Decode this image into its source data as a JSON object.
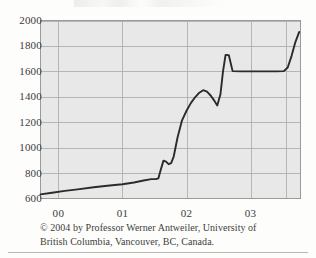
{
  "figure": {
    "title_remnant": "",
    "caption_line1": "© 2004 by Professor Werner Antweiler, University of",
    "caption_line2": "British Columbia, Vancouver, BC, Canada.",
    "caption_full": "© 2004 by Professor Werner Antweiler, University of British Columbia, Vancouver, BC, Canada."
  },
  "colors": {
    "page_background": "#fdfdfb",
    "plot_background": "#e8e8e8",
    "gridline": "#b0b0b0",
    "plot_border": "#9a9a9a",
    "line": "#2b2b2b",
    "text": "#3b3b3b",
    "rule": "#b9b7b2"
  },
  "chart_data": {
    "type": "line",
    "title": "",
    "xlabel": "",
    "ylabel": "",
    "xlim": [
      1999.72,
      2003.78
    ],
    "ylim": [
      600,
      2000
    ],
    "grid": true,
    "legend": null,
    "legend_position": "none",
    "ytick_labels": [
      "2000",
      "1800",
      "1600",
      "1400",
      "1200",
      "1000",
      "800",
      "600"
    ],
    "ytick_values": [
      2000,
      1800,
      1600,
      1400,
      1200,
      1000,
      800,
      600
    ],
    "xtick_labels": [
      "00",
      "01",
      "02",
      "03"
    ],
    "xtick_values": [
      2000,
      2001,
      2002,
      2003
    ],
    "series": [
      {
        "name": "value",
        "x": [
          1999.72,
          1999.9,
          2000.1,
          2000.3,
          2000.55,
          2000.8,
          2001.0,
          2001.18,
          2001.33,
          2001.45,
          2001.52,
          2001.56,
          2001.6,
          2001.64,
          2001.68,
          2001.72,
          2001.76,
          2001.8,
          2001.86,
          2001.93,
          2002.0,
          2002.07,
          2002.14,
          2002.2,
          2002.26,
          2002.32,
          2002.38,
          2002.43,
          2002.48,
          2002.53,
          2002.57,
          2002.61,
          2002.66,
          2002.72,
          2002.85,
          2003.0,
          2003.2,
          2003.4,
          2003.52,
          2003.58,
          2003.64,
          2003.7,
          2003.76
        ],
        "y": [
          632,
          645,
          660,
          672,
          688,
          702,
          712,
          726,
          742,
          752,
          752,
          758,
          830,
          898,
          890,
          870,
          878,
          930,
          1080,
          1215,
          1290,
          1352,
          1400,
          1432,
          1452,
          1440,
          1408,
          1372,
          1332,
          1420,
          1600,
          1730,
          1728,
          1602,
          1600,
          1600,
          1600,
          1600,
          1602,
          1630,
          1720,
          1830,
          1910
        ]
      }
    ]
  }
}
